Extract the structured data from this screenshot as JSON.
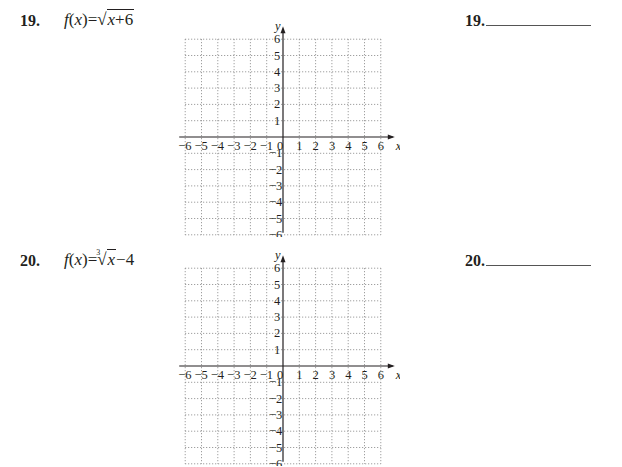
{
  "problems": [
    {
      "number": "19.",
      "function_lhs": "f(x)",
      "equals": "=",
      "radical_type": "square-root",
      "radicand": "x+6",
      "trailing": "",
      "answer_label": "19.",
      "grid": {
        "xmin": -6,
        "xmax": 6,
        "ymin": -6,
        "ymax": 6,
        "x_label": "x",
        "y_label": "y"
      }
    },
    {
      "number": "20.",
      "function_lhs": "f(x)",
      "equals": "=",
      "radical_type": "cube-root",
      "radical_index": "3",
      "radicand": "x",
      "trailing": "−4",
      "answer_label": "20.",
      "grid": {
        "xmin": -6,
        "xmax": 6,
        "ymin": -6,
        "ymax": 6,
        "x_label": "x",
        "y_label": "y"
      }
    }
  ],
  "axis_ticks": {
    "x": [
      "−6",
      "−5",
      "−4",
      "−3",
      "−2",
      "−1",
      "0",
      "1",
      "2",
      "3",
      "4",
      "5",
      "6"
    ],
    "y_pos": [
      "1",
      "2",
      "3",
      "4",
      "5",
      "6"
    ],
    "y_neg": [
      "−1",
      "−2",
      "−3",
      "−4",
      "−5",
      "−6"
    ]
  },
  "colors": {
    "ink": "#231f20",
    "grid": "#8a8a8a",
    "answer_line": "#555555"
  }
}
